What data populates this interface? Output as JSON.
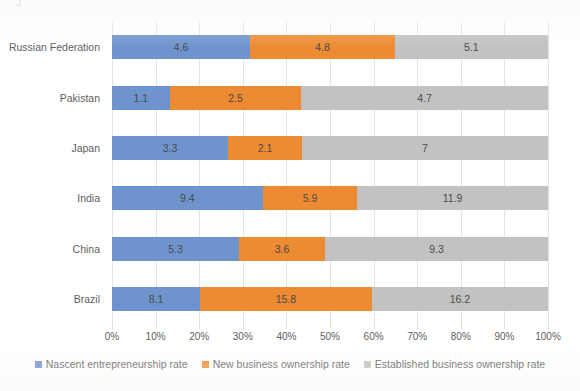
{
  "artifact": {
    "top_left_text": "J"
  },
  "chart_data": {
    "type": "bar",
    "subtype": "100% stacked horizontal bar",
    "title": "",
    "xlabel": "",
    "ylabel": "",
    "categories": [
      "Russian Federation",
      "Pakistan",
      "Japan",
      "India",
      "China",
      "Brazil"
    ],
    "series": [
      {
        "name": "Nascent entrepreneurship rate",
        "color": "#6f93cd",
        "values": [
          4.6,
          1.1,
          3.3,
          9.4,
          5.3,
          8.1
        ]
      },
      {
        "name": "New business ownership rate",
        "color": "#ed8b32",
        "values": [
          4.8,
          2.5,
          2.1,
          5.9,
          3.6,
          15.8
        ]
      },
      {
        "name": "Established business ownership rate",
        "color": "#c2c2c2",
        "values": [
          5.1,
          4.7,
          7.0,
          11.9,
          9.3,
          16.2
        ]
      }
    ],
    "value_labels": [
      [
        "4.6",
        "4.8",
        "5.1"
      ],
      [
        "1.1",
        "2.5",
        "4.7"
      ],
      [
        "3.3",
        "2.1",
        "7"
      ],
      [
        "9.4",
        "5.9",
        "11.9"
      ],
      [
        "5.3",
        "3.6",
        "9.3"
      ],
      [
        "8.1",
        "15.8",
        "16.2"
      ]
    ],
    "xlim": [
      0,
      100
    ],
    "xticks": [
      0,
      10,
      20,
      30,
      40,
      50,
      60,
      70,
      80,
      90,
      100
    ],
    "xtick_labels": [
      "0%",
      "10%",
      "20%",
      "30%",
      "40%",
      "50%",
      "60%",
      "70%",
      "80%",
      "90%",
      "100%"
    ],
    "grid": true,
    "grid_axis": "x",
    "legend_position": "bottom"
  }
}
